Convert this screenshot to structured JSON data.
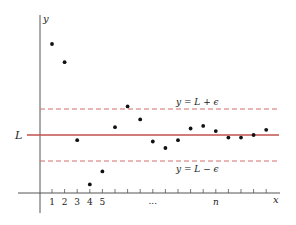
{
  "chart_data": {
    "type": "scatter",
    "title": "",
    "xlabel": "x",
    "ylabel": "y",
    "x_tick_labels": [
      "1",
      "2",
      "3",
      "4",
      "5",
      "...",
      "n"
    ],
    "limit_label": "L",
    "upper_band_label": "y = L + ϵ",
    "lower_band_label": "y = L − ϵ",
    "grid": false,
    "legend": "none",
    "L": 0,
    "epsilon": 1,
    "ylim": [
      -2.3,
      3.6
    ],
    "x": [
      1,
      2,
      3,
      4,
      5,
      6,
      7,
      8,
      9,
      10,
      11,
      12,
      13,
      14,
      15,
      16,
      17,
      18
    ],
    "values": [
      3.5,
      2.8,
      -0.2,
      -1.9,
      -1.4,
      0.3,
      1.1,
      0.6,
      -0.25,
      -0.5,
      -0.2,
      0.25,
      0.35,
      0.15,
      -0.1,
      -0.1,
      0.0,
      0.2
    ],
    "colors": {
      "limit_line": "#c0504d",
      "band_lines": "#d46a6a",
      "points": "#111111",
      "axes": "#555555"
    }
  }
}
